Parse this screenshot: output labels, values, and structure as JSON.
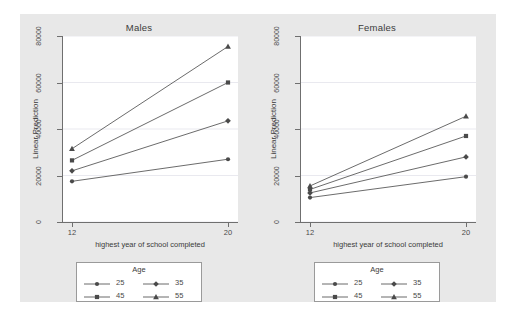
{
  "chart_data": {
    "type": "line",
    "title": "",
    "panels": [
      {
        "title": "Males",
        "xlabel": "highest year of school completed",
        "ylabel": "Linear Prediction",
        "x": [
          12,
          20
        ],
        "xlim": [
          12,
          20
        ],
        "ylim": [
          0,
          80000
        ],
        "xticks": [
          "12",
          "20"
        ],
        "yticks": [
          "0",
          "20000",
          "40000",
          "60000",
          "80000"
        ],
        "ytickvals": [
          0,
          20000,
          40000,
          60000,
          80000
        ],
        "grid": true,
        "series": [
          {
            "name": "25",
            "marker": "circle",
            "values": [
              17500,
              27000
            ]
          },
          {
            "name": "35",
            "marker": "diamond",
            "values": [
              22000,
              43500
            ]
          },
          {
            "name": "45",
            "marker": "square",
            "values": [
              26500,
              60000
            ]
          },
          {
            "name": "55",
            "marker": "triangle",
            "values": [
              31500,
              75500
            ]
          }
        ]
      },
      {
        "title": "Females",
        "xlabel": "highest year of school completed",
        "ylabel": "Linear Prediction",
        "x": [
          12,
          20
        ],
        "xlim": [
          12,
          20
        ],
        "ylim": [
          0,
          80000
        ],
        "xticks": [
          "12",
          "20"
        ],
        "yticks": [
          "0",
          "20000",
          "40000",
          "60000",
          "80000"
        ],
        "ytickvals": [
          0,
          20000,
          40000,
          60000,
          80000
        ],
        "grid": true,
        "series": [
          {
            "name": "25",
            "marker": "circle",
            "values": [
              10500,
              19500
            ]
          },
          {
            "name": "35",
            "marker": "diamond",
            "values": [
              12500,
              28000
            ]
          },
          {
            "name": "45",
            "marker": "square",
            "values": [
              14000,
              37000
            ]
          },
          {
            "name": "55",
            "marker": "triangle",
            "values": [
              15500,
              45500
            ]
          }
        ]
      }
    ],
    "legend": {
      "title": "Age",
      "entries": [
        {
          "label": "25",
          "marker": "circle"
        },
        {
          "label": "35",
          "marker": "diamond"
        },
        {
          "label": "45",
          "marker": "square"
        },
        {
          "label": "55",
          "marker": "triangle"
        }
      ]
    },
    "colors": {
      "line": "#5a5a5a",
      "marker": "#4a4a4a",
      "grid": "#e9e9ef",
      "axis": "#6f6f6f",
      "plot_background": "#ffffff",
      "graph_background": "#e8e8e8",
      "page_background": "#ffffff",
      "text": "#3b3b3b"
    }
  }
}
